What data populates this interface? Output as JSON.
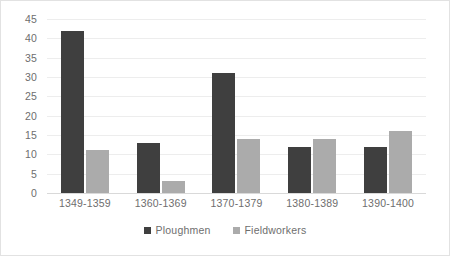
{
  "chart_data": {
    "type": "bar",
    "title": "",
    "xlabel": "",
    "ylabel": "",
    "categories": [
      "1349-1359",
      "1360-1369",
      "1370-1379",
      "1380-1389",
      "1390-1400"
    ],
    "series": [
      {
        "name": "Ploughmen",
        "color": "#3f3f3f",
        "values": [
          42,
          13,
          31,
          12,
          12
        ]
      },
      {
        "name": "Fieldworkers",
        "color": "#ababab",
        "values": [
          11,
          3,
          14,
          14,
          16
        ]
      }
    ],
    "ylim": [
      0,
      45
    ],
    "ytick_step": 5,
    "yticks": [
      45,
      40,
      35,
      30,
      25,
      20,
      15,
      10,
      5,
      0
    ],
    "grid": true,
    "legend_position": "bottom",
    "background": "#ffffff",
    "gridline_color": "#ededed",
    "border_color": "#e2e2e2",
    "text_color": "#6e6e6e"
  }
}
